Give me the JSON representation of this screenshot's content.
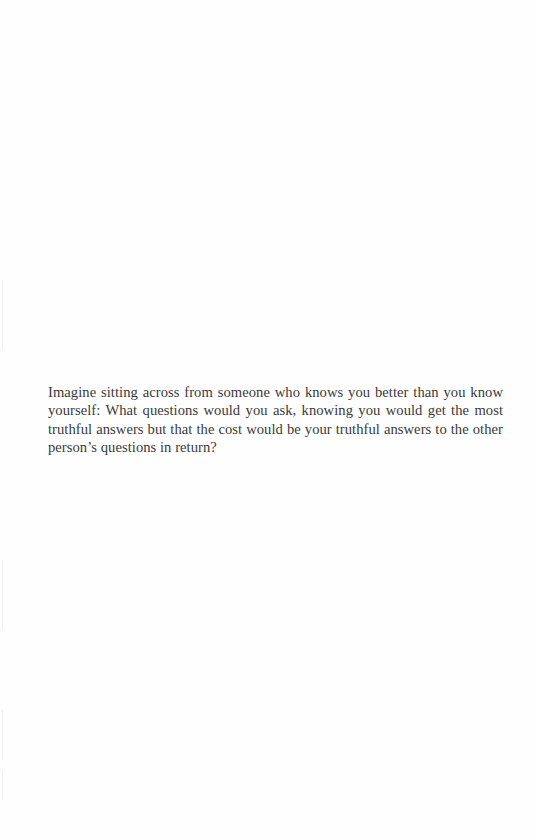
{
  "page": {
    "background": "#fefefe",
    "text_color": "#3a3a3a"
  },
  "passage": {
    "text": "Imagine sitting across from someone who knows you better than you know yourself: What questions would you ask, knowing you would get the most truthful answers but that the cost would be your truthful answers to the other person’s questions in return?"
  }
}
